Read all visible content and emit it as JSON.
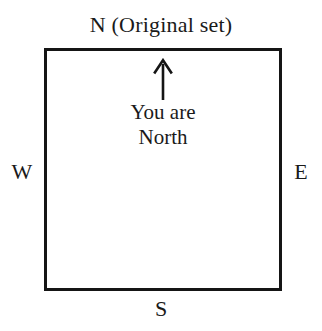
{
  "diagram": {
    "type": "orientation-map",
    "background_color": "#ffffff",
    "ink_color": "#151515",
    "title": "N (Original set)",
    "shape": {
      "name": "original-set-square",
      "border_color": "#151515",
      "border_width_px": 3,
      "fill": "#ffffff"
    },
    "cardinals": {
      "north": "N (Original set)",
      "west": "W",
      "east": "E",
      "south": "S"
    },
    "interior": {
      "arrow": {
        "icon": "arrow-up-icon",
        "direction": "up",
        "points_to": "N"
      },
      "caption_line_1": "You are",
      "caption_line_2": "North"
    }
  }
}
